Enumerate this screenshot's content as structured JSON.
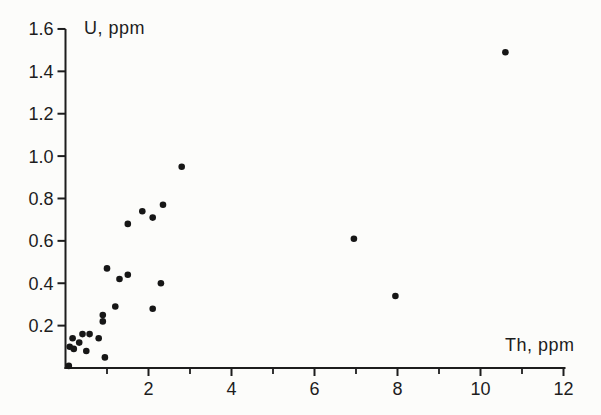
{
  "figure": {
    "background": "#fcfcfa",
    "ink": "#1d1d1d",
    "marker_color": "#161616"
  },
  "chart_data": {
    "type": "scatter",
    "title": "",
    "xlabel": "Th, ppm",
    "ylabel": "U, ppm",
    "xlim": [
      0,
      12
    ],
    "ylim": [
      0,
      1.6
    ],
    "grid": false,
    "legend": "none",
    "x_major_ticks": [
      "2",
      "4",
      "6",
      "8",
      "10",
      "12"
    ],
    "x_minor_ticks": [
      1,
      3,
      5,
      7,
      9,
      11
    ],
    "y_ticks": [
      "0.2",
      "0.4",
      "0.6",
      "0.8",
      "1.0",
      "1.2",
      "1.4",
      "1.6"
    ],
    "marker": {
      "shape": "circle",
      "radius_px": 3.3
    },
    "points": [
      {
        "th": 0.08,
        "u": 0.01
      },
      {
        "th": 0.1,
        "u": 0.1
      },
      {
        "th": 0.17,
        "u": 0.14
      },
      {
        "th": 0.2,
        "u": 0.09
      },
      {
        "th": 0.33,
        "u": 0.12
      },
      {
        "th": 0.41,
        "u": 0.16
      },
      {
        "th": 0.5,
        "u": 0.08
      },
      {
        "th": 0.58,
        "u": 0.16
      },
      {
        "th": 0.8,
        "u": 0.14
      },
      {
        "th": 0.9,
        "u": 0.25
      },
      {
        "th": 0.9,
        "u": 0.22
      },
      {
        "th": 0.95,
        "u": 0.05
      },
      {
        "th": 1.0,
        "u": 0.47
      },
      {
        "th": 1.2,
        "u": 0.29
      },
      {
        "th": 1.3,
        "u": 0.42
      },
      {
        "th": 1.5,
        "u": 0.44
      },
      {
        "th": 1.5,
        "u": 0.68
      },
      {
        "th": 1.85,
        "u": 0.74
      },
      {
        "th": 2.1,
        "u": 0.71
      },
      {
        "th": 2.1,
        "u": 0.28
      },
      {
        "th": 2.3,
        "u": 0.4
      },
      {
        "th": 2.35,
        "u": 0.77
      },
      {
        "th": 2.8,
        "u": 0.95
      },
      {
        "th": 6.95,
        "u": 0.61
      },
      {
        "th": 7.95,
        "u": 0.34
      },
      {
        "th": 10.6,
        "u": 1.49
      }
    ]
  }
}
